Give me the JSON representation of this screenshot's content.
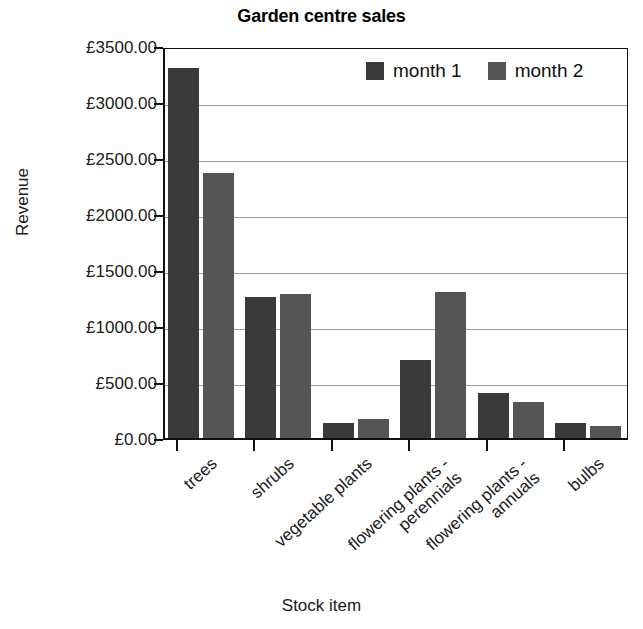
{
  "chart_data": {
    "type": "bar",
    "title": "Garden centre sales",
    "xlabel": "Stock item",
    "ylabel": "Revenue",
    "categories": [
      "trees",
      "shrubs",
      "vegetable plants",
      "flowering plants -\nperennials",
      "flowering plants -\nannuals",
      "bulbs"
    ],
    "series": [
      {
        "name": "month 1",
        "color": "#3a3a3a",
        "values": [
          3300,
          1260,
          130,
          700,
          400,
          130
        ]
      },
      {
        "name": "month 2",
        "color": "#555555",
        "values": [
          2370,
          1290,
          170,
          1300,
          320,
          110
        ]
      }
    ],
    "ylim": [
      0,
      3500
    ],
    "ytick_values": [
      0,
      500,
      1000,
      1500,
      2000,
      2500,
      3000,
      3500
    ],
    "ytick_labels": [
      "£0.00",
      "£500.00",
      "£1000.00",
      "£1500.00",
      "£2000.00",
      "£2500.00",
      "£3000.00",
      "£3500.00"
    ],
    "grid": "horizontal",
    "legend_position": "top-right-inside",
    "currency_symbol": "£"
  }
}
